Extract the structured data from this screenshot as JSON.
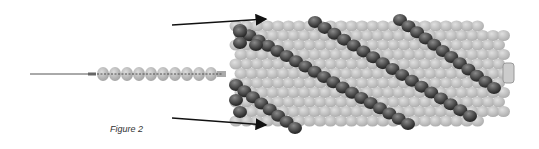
{
  "figure": {
    "caption": "Figure 2",
    "colors": {
      "light_bead": "#b9b9b9",
      "dark_bead": "#4a4a4a",
      "thread": "#555555",
      "arrow": "#111111"
    },
    "strand": {
      "bead_count": 10,
      "x_start": 97,
      "y": 74,
      "bead_spacing": 12
    },
    "tube": {
      "x": 228,
      "y": 18,
      "width": 280,
      "height": 112,
      "spiral_count": 3
    },
    "arrows": [
      {
        "from": [
          172,
          25
        ],
        "to": [
          266,
          19
        ]
      },
      {
        "from": [
          172,
          118
        ],
        "to": [
          266,
          125
        ]
      }
    ]
  }
}
